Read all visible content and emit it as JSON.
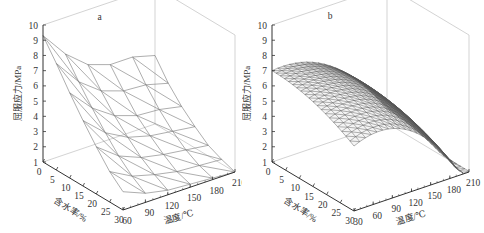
{
  "chart_data": [
    {
      "type": "surface3d",
      "panel_label": "a",
      "zlabel": "屈服应力/MPa",
      "xlabel": "含水率/%",
      "ylabel": "温度/℃",
      "z_ticks": [
        "1",
        "2",
        "3",
        "4",
        "5",
        "6",
        "7",
        "8",
        "9",
        "10"
      ],
      "x_ticks": [
        "0",
        "5",
        "10",
        "15",
        "20",
        "25",
        "30"
      ],
      "y_ticks": [
        "60",
        "90",
        "120",
        "150",
        "180",
        "210"
      ],
      "zlim": [
        1,
        10
      ],
      "xlim": [
        0,
        30
      ],
      "ylim": [
        60,
        210
      ],
      "grid_moisture": [
        0,
        5,
        10,
        15,
        20,
        25,
        30
      ],
      "grid_temperature": [
        60,
        90,
        120,
        150,
        180,
        210
      ],
      "z_values": [
        [
          9.3,
          7.6,
          6.4,
          5.9,
          5.9,
          5.5
        ],
        [
          8.0,
          6.3,
          5.2,
          4.7,
          4.6,
          4.2
        ],
        [
          6.6,
          5.1,
          4.1,
          3.6,
          3.5,
          3.2
        ],
        [
          5.3,
          4.0,
          3.2,
          2.8,
          2.6,
          2.4
        ],
        [
          4.1,
          3.0,
          2.4,
          2.1,
          1.9,
          1.7
        ],
        [
          3.0,
          2.2,
          1.8,
          1.5,
          1.4,
          1.3
        ],
        [
          2.2,
          1.6,
          1.3,
          1.2,
          1.1,
          1.0
        ]
      ]
    },
    {
      "type": "surface3d",
      "panel_label": "b",
      "zlabel": "屈服应力/MPa",
      "xlabel": "含水率/%",
      "ylabel": "温度/℃",
      "z_ticks": [
        "1",
        "2",
        "3",
        "4",
        "5",
        "6",
        "7",
        "8",
        "9",
        "10"
      ],
      "x_ticks": [
        "0",
        "5",
        "10",
        "15",
        "20",
        "25",
        "30"
      ],
      "y_ticks": [
        "30",
        "60",
        "90",
        "120",
        "150",
        "180",
        "210"
      ],
      "zlim": [
        1,
        10
      ],
      "xlim": [
        0,
        30
      ],
      "ylim": [
        30,
        210
      ],
      "grid_moisture": [
        0,
        2.5,
        5,
        7.5,
        10,
        12.5,
        15,
        17.5,
        20,
        22.5,
        25,
        27.5,
        30
      ],
      "grid_temperature": [
        30,
        45,
        60,
        75,
        90,
        105,
        120,
        135,
        150,
        165,
        180,
        195,
        210
      ],
      "surface_model": "z = 7.0 - 0.0035*m^2 - 0.00021*(T-30)^2*(1+0.02*m) + 0.0004*m*(T-30)"
    }
  ]
}
